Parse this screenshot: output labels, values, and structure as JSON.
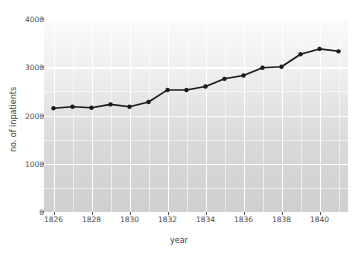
{
  "chart_data": {
    "type": "line",
    "title": "",
    "xlabel": "year",
    "ylabel": "no. of inpatients",
    "xlim": [
      1825.5,
      1841.5
    ],
    "ylim": [
      0,
      4000
    ],
    "xticks": [
      1826,
      1828,
      1830,
      1832,
      1834,
      1836,
      1838,
      1840
    ],
    "yticks": [
      0,
      1000,
      2000,
      3000,
      4000
    ],
    "xtick_labels": [
      "1826",
      "1828",
      "1830",
      "1832",
      "1834",
      "1836",
      "1838",
      "1840"
    ],
    "ytick_labels": [
      "0",
      "1000",
      "2000",
      "3000",
      "4000"
    ],
    "x_minor_ticks": [
      1827,
      1829,
      1831,
      1833,
      1835,
      1837,
      1839,
      1841
    ],
    "y_minor_ticks": [
      500,
      1500,
      2500,
      3500
    ],
    "grid": true,
    "legend": "none",
    "marker": "circle",
    "line_color": "#1a1a1a",
    "marker_color": "#1a1a1a",
    "panel_background": "#d9d9d9",
    "grid_color": "#ffffff",
    "x": [
      1826,
      1827,
      1828,
      1829,
      1830,
      1831,
      1832,
      1833,
      1834,
      1835,
      1836,
      1837,
      1838,
      1839,
      1840,
      1841
    ],
    "values": [
      2150,
      2180,
      2160,
      2230,
      2180,
      2280,
      2530,
      2530,
      2600,
      2760,
      2830,
      2990,
      3010,
      3270,
      3380,
      3330
    ]
  }
}
